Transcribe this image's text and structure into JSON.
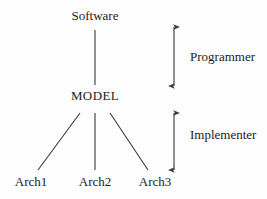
{
  "diagram": {
    "background_color": "#fdfdfd",
    "stroke_color": "#3a3a3a",
    "text_color": "#1c1c1c",
    "nodes": [
      {
        "id": "software",
        "label": "Software",
        "x": 95,
        "y": 16
      },
      {
        "id": "model",
        "label": "MODEL",
        "x": 95,
        "y": 96
      },
      {
        "id": "arch1",
        "label": "Arch1",
        "x": 31,
        "y": 182
      },
      {
        "id": "arch2",
        "label": "Arch2",
        "x": 95,
        "y": 182
      },
      {
        "id": "arch3",
        "label": "Arch3",
        "x": 155,
        "y": 182
      }
    ],
    "edges": [
      {
        "from": "software",
        "to": "model",
        "x1": 95,
        "y1": 30,
        "x2": 95,
        "y2": 85
      },
      {
        "from": "model",
        "to": "arch1",
        "x1": 80,
        "y1": 113,
        "x2": 38,
        "y2": 170
      },
      {
        "from": "model",
        "to": "arch2",
        "x1": 95,
        "y1": 113,
        "x2": 95,
        "y2": 170
      },
      {
        "from": "model",
        "to": "arch3",
        "x1": 110,
        "y1": 113,
        "x2": 148,
        "y2": 170
      }
    ],
    "annotations": [
      {
        "id": "programmer",
        "label": "Programmer",
        "arrow": {
          "x": 174,
          "y_top": 27,
          "y_bottom": 86
        },
        "label_x": 190,
        "label_y": 57
      },
      {
        "id": "implementer",
        "label": "Implementer",
        "arrow": {
          "x": 174,
          "y_top": 113,
          "y_bottom": 170
        },
        "label_x": 190,
        "label_y": 135
      }
    ]
  }
}
